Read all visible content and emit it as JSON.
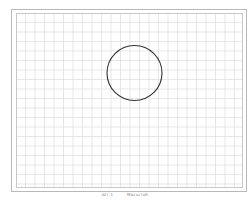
{
  "canvas": {
    "grid_spacing_px": 9.5,
    "grid_color": "#dcdcdc",
    "frame_color": "#b9b9b9"
  },
  "shape": {
    "type": "circle",
    "cx": 134.5,
    "cy": 73,
    "r": 27.5,
    "stroke": "#333333"
  },
  "caption": {
    "left": "Шт.1",
    "right": "Масштаб"
  }
}
